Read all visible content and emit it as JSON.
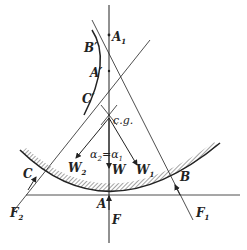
{
  "diagram": {
    "type": "force diagram",
    "labels": {
      "A1": {
        "main": "A",
        "sub": "1"
      },
      "B_prime": "B′",
      "A_prime": "A′",
      "C_prime": "C′",
      "cg": "c.g.",
      "alpha": {
        "a2": "α",
        "a2_sub": "2",
        "sep": "=",
        "a1": "α",
        "a1_sub": "1"
      },
      "W2": {
        "main": "W",
        "sub": "2"
      },
      "W": "W",
      "W1": {
        "main": "W",
        "sub": "1"
      },
      "C": "C",
      "B": "B",
      "A": "A",
      "F2": {
        "main": "F",
        "sub": "2"
      },
      "F": "F",
      "F1": {
        "main": "F",
        "sub": "1"
      }
    },
    "colors": {
      "ink": "#222222",
      "background": "#ffffff"
    }
  }
}
